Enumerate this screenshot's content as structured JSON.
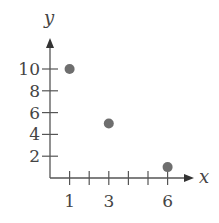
{
  "chart_data": {
    "type": "scatter",
    "title": "",
    "xlabel": "x",
    "ylabel": "y",
    "x_ticks": [
      1,
      2,
      3,
      4,
      5,
      6
    ],
    "x_tick_labels": [
      "1",
      "",
      "3",
      "",
      "",
      "6"
    ],
    "y_ticks": [
      2,
      4,
      6,
      8,
      10
    ],
    "y_tick_labels": [
      "2",
      "4",
      "6",
      "8",
      "10"
    ],
    "xlim": [
      0,
      6.5
    ],
    "ylim": [
      0,
      11.5
    ],
    "grid": false,
    "points": [
      {
        "x": 1,
        "y": 10
      },
      {
        "x": 3,
        "y": 5
      },
      {
        "x": 6,
        "y": 1
      }
    ],
    "colors": {
      "axis": "#555555",
      "point": "#6e6e6e"
    }
  }
}
